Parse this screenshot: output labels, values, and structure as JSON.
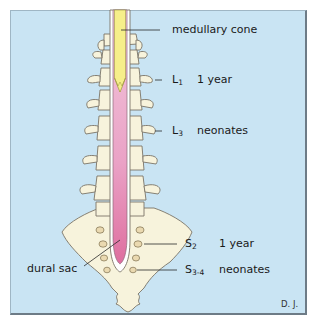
{
  "figure": {
    "title": "",
    "background_color": "#c9e4f3",
    "colors": {
      "spinal_cord": "#f6ef8a",
      "dural_sac": "#eeb0cf",
      "dural_sac_lower": "#e27aa8",
      "bone": "#f7f3dc",
      "outline": "#7a7466"
    },
    "labels": {
      "medullary_cone": "medullary cone",
      "l1_level": "L",
      "l1_sub": "1",
      "l1_age": "1 year",
      "l3_level": "L",
      "l3_sub": "3",
      "l3_age": "neonates",
      "s2_level": "S",
      "s2_sub": "2",
      "s2_age": "1 year",
      "s34_level": "S",
      "s34_sub": "3-4",
      "s34_age": "neonates",
      "dural_sac": "dural sac",
      "credit": "D. J."
    }
  }
}
